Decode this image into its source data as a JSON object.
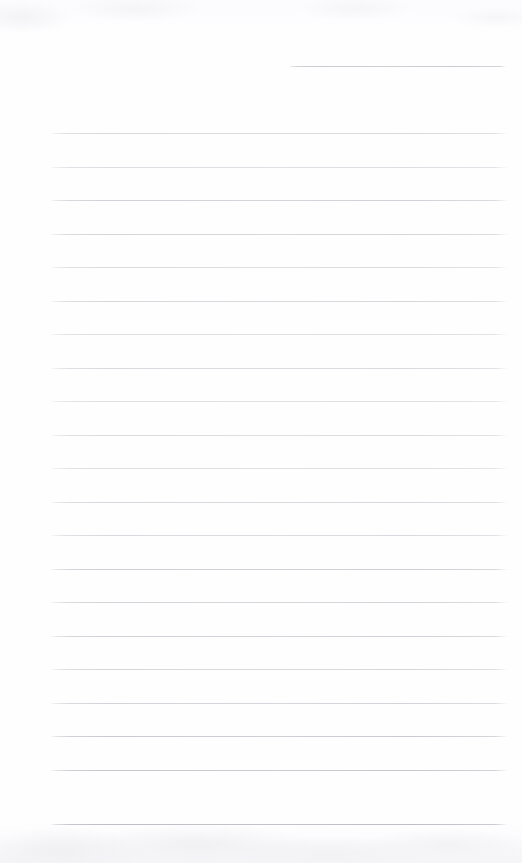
{
  "document": {
    "kind": "scanned-lined-paper",
    "title": "Blank ruled notebook page",
    "page_width": 522,
    "page_height": 863,
    "background_color": "#fefeff",
    "content_text": "",
    "has_handwriting": false,
    "has_printed_text": false
  },
  "ruling": {
    "line_color": "#b9b9c0",
    "line_color_light": "#cdcdd4",
    "line_thickness_px": 1,
    "line_spacing_px": 33.4,
    "full_line_left_px": 50,
    "full_line_right_px": 508,
    "short_line_left_px": 289,
    "total_lines": 22,
    "lines": [
      {
        "index": 1,
        "y": 66,
        "x1": 289,
        "x2": 506,
        "opacity": 0.72,
        "color": "#b6b6be"
      },
      {
        "index": 2,
        "y": 133,
        "x1": 50,
        "x2": 508,
        "opacity": 0.62,
        "color": "#c2c2c9"
      },
      {
        "index": 3,
        "y": 167,
        "x1": 50,
        "x2": 508,
        "opacity": 0.58,
        "color": "#c5c5cc"
      },
      {
        "index": 4,
        "y": 200,
        "x1": 50,
        "x2": 508,
        "opacity": 0.68,
        "color": "#bcbcc4"
      },
      {
        "index": 5,
        "y": 234,
        "x1": 50,
        "x2": 508,
        "opacity": 0.66,
        "color": "#bfbfc6"
      },
      {
        "index": 6,
        "y": 267,
        "x1": 50,
        "x2": 508,
        "opacity": 0.6,
        "color": "#c4c4cb"
      },
      {
        "index": 7,
        "y": 301,
        "x1": 50,
        "x2": 508,
        "opacity": 0.64,
        "color": "#c0c0c8"
      },
      {
        "index": 8,
        "y": 334,
        "x1": 50,
        "x2": 508,
        "opacity": 0.58,
        "color": "#c6c6cd"
      },
      {
        "index": 9,
        "y": 368,
        "x1": 50,
        "x2": 508,
        "opacity": 0.62,
        "color": "#c2c2ca"
      },
      {
        "index": 10,
        "y": 401,
        "x1": 50,
        "x2": 508,
        "opacity": 0.56,
        "color": "#c8c8ce"
      },
      {
        "index": 11,
        "y": 435,
        "x1": 50,
        "x2": 508,
        "opacity": 0.6,
        "color": "#c4c4cb"
      },
      {
        "index": 12,
        "y": 468,
        "x1": 50,
        "x2": 508,
        "opacity": 0.58,
        "color": "#c6c6cd"
      },
      {
        "index": 13,
        "y": 502,
        "x1": 50,
        "x2": 508,
        "opacity": 0.64,
        "color": "#c0c0c8"
      },
      {
        "index": 14,
        "y": 535,
        "x1": 50,
        "x2": 508,
        "opacity": 0.62,
        "color": "#c2c2ca"
      },
      {
        "index": 15,
        "y": 569,
        "x1": 50,
        "x2": 508,
        "opacity": 0.7,
        "color": "#b9b9c1"
      },
      {
        "index": 16,
        "y": 602,
        "x1": 50,
        "x2": 508,
        "opacity": 0.66,
        "color": "#bdbdc5"
      },
      {
        "index": 17,
        "y": 636,
        "x1": 50,
        "x2": 508,
        "opacity": 0.68,
        "color": "#bbbbc3"
      },
      {
        "index": 18,
        "y": 669,
        "x1": 50,
        "x2": 508,
        "opacity": 0.64,
        "color": "#c0c0c7"
      },
      {
        "index": 19,
        "y": 703,
        "x1": 50,
        "x2": 508,
        "opacity": 0.66,
        "color": "#bdbdc5"
      },
      {
        "index": 20,
        "y": 736,
        "x1": 50,
        "x2": 508,
        "opacity": 0.72,
        "color": "#b6b6be"
      },
      {
        "index": 21,
        "y": 770,
        "x1": 50,
        "x2": 508,
        "opacity": 0.74,
        "color": "#b3b3bc"
      },
      {
        "index": 22,
        "y": 824,
        "x1": 50,
        "x2": 508,
        "opacity": 0.8,
        "color": "#aeaeb7"
      }
    ]
  },
  "artifacts": {
    "bottom_smudge_band": true,
    "top_mottling": true,
    "edge_fade": true
  }
}
